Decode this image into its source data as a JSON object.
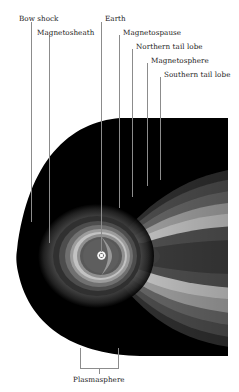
{
  "figure": {
    "width": 239,
    "height": 392,
    "background": "#ffffff"
  },
  "labels": {
    "bow_shock": "Bow shock",
    "magnetosheath": "Magnetosheath",
    "earth": "Earth",
    "magnetopause": "Magnetospause",
    "northern_tail_lobe": "Northern tail lobe",
    "magnetosphere": "Magnetosphere",
    "southern_tail_lobe": "Southern tail lobe",
    "plasmasphere": "Plasmasphere"
  },
  "leader_lines": {
    "color": "#8c8c8c",
    "items": [
      {
        "name": "bow-shock",
        "x": 31,
        "y_top": 22,
        "y_bottom": 222
      },
      {
        "name": "magnetosheath",
        "x": 49,
        "y_top": 35,
        "y_bottom": 243
      },
      {
        "name": "earth",
        "x": 101,
        "y_top": 22,
        "y_bottom": 252
      },
      {
        "name": "magnetopause",
        "x": 119,
        "y_top": 35,
        "y_bottom": 208
      },
      {
        "name": "northern-tail-lobe",
        "x": 132,
        "y_top": 49,
        "y_bottom": 197
      },
      {
        "name": "magnetosphere",
        "x": 147,
        "y_top": 63,
        "y_bottom": 186
      },
      {
        "name": "southern-tail-lobe",
        "x": 160,
        "y_top": 77,
        "y_bottom": 180
      }
    ]
  },
  "bracket": {
    "name": "plasmasphere-bracket",
    "left": 80,
    "right": 118,
    "top": 348,
    "bottom": 368,
    "stem_x": 99,
    "stem_bottom": 374,
    "color": "#8c8c8c"
  },
  "colors": {
    "background": "#ffffff",
    "cavity": "#000000",
    "band_1": "#3d3d3d",
    "band_2": "#565656",
    "band_3": "#6e6e6e",
    "band_4": "#878787",
    "band_5": "#a0a0a0",
    "band_6": "#b8b8b8",
    "band_7": "#cfcfcf",
    "earth_dot": "#f2f2f2",
    "earth_core": "#5a5a5a",
    "leader": "#8c8c8c",
    "text": "#1a1a1a"
  },
  "diagram_data": {
    "type": "schematic",
    "subject": "Earth's magnetosphere in the noon-midnight meridian plane",
    "cavity": {
      "description": "black teardrop/elliptical magnetospheric cavity, blunt sunward nose at left, tail extending off the right edge",
      "nose_x": 16,
      "center_y": 256,
      "top_y": 118,
      "bottom_y": 356,
      "right_clip_x": 228
    },
    "earth": {
      "cx": 101.5,
      "cy": 255.5,
      "r": 3.6
    },
    "features": [
      {
        "name": "bow shock",
        "position": "outer sunward boundary at far left of cavity"
      },
      {
        "name": "magnetosheath",
        "position": "shocked plasma layer between bow shock and magnetopause"
      },
      {
        "name": "magnetopause",
        "position": "boundary surface enclosing the magnetosphere"
      },
      {
        "name": "northern tail lobe",
        "position": "upper grey band of the magnetotail"
      },
      {
        "name": "magnetosphere",
        "position": "whole cavity dominated by Earth's field"
      },
      {
        "name": "southern tail lobe",
        "position": "lower grey band of the magnetotail"
      },
      {
        "name": "plasmasphere",
        "position": "dense cold plasma torus immediately around Earth"
      }
    ],
    "shading_bands": [
      {
        "level": 1,
        "gray": "#000000"
      },
      {
        "level": 2,
        "gray": "#3d3d3d"
      },
      {
        "level": 3,
        "gray": "#565656"
      },
      {
        "level": 4,
        "gray": "#6e6e6e"
      },
      {
        "level": 5,
        "gray": "#878787"
      },
      {
        "level": 6,
        "gray": "#a0a0a0"
      },
      {
        "level": 7,
        "gray": "#b8b8b8"
      },
      {
        "level": 8,
        "gray": "#cfcfcf"
      }
    ]
  }
}
